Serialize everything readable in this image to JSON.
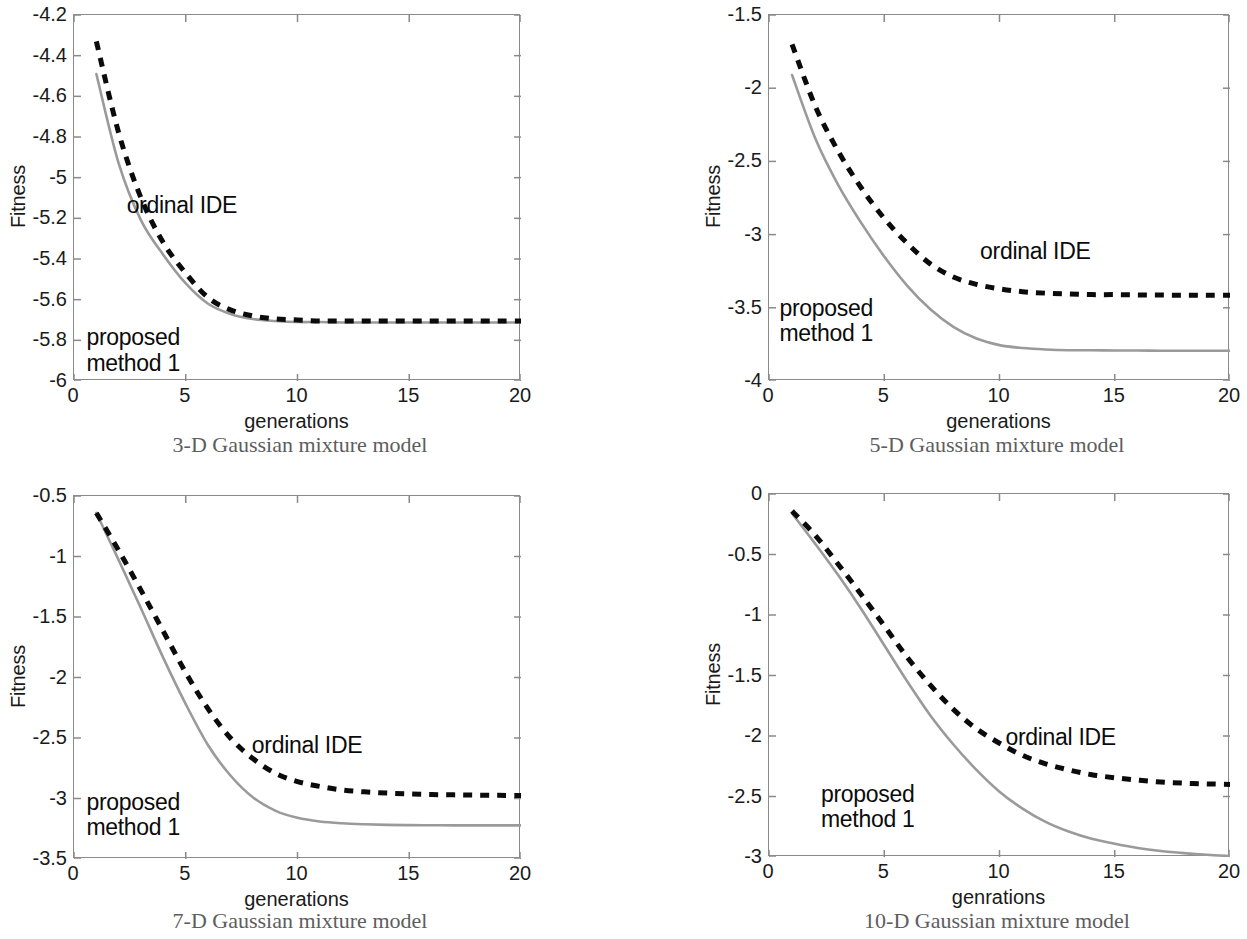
{
  "figure": {
    "background": "#ffffff",
    "axis_color": "#8a8a8a",
    "solid_series_color": "#9a9a9a",
    "dashed_series_color": "#0b0b0b"
  },
  "panels": [
    {
      "id": "panel-3d",
      "caption": "3-D Gaussian mixture model",
      "chart_data": {
        "type": "line",
        "title": "",
        "xlabel": "generations",
        "ylabel": "Fitness",
        "xlim": [
          0,
          20
        ],
        "ylim": [
          -6,
          -4.2
        ],
        "xticks": [
          0,
          5,
          10,
          15,
          20
        ],
        "xticklabels": [
          "0",
          "5",
          "10",
          "15",
          "20"
        ],
        "yticks": [
          -6,
          -5.8,
          -5.6,
          -5.4,
          -5.2,
          -5,
          -4.8,
          -4.6,
          -4.4,
          -4.2
        ],
        "yticklabels": [
          "-6",
          "-5.8",
          "-5.6",
          "-5.4",
          "-5.2",
          "-5",
          "-4.8",
          "-4.6",
          "-4.4",
          "-4.2"
        ],
        "grid": false,
        "legend": "inline-annotations",
        "x": [
          1,
          2,
          3,
          4,
          5,
          6,
          7,
          8,
          9,
          10,
          11,
          12,
          13,
          14,
          15,
          16,
          17,
          18,
          19,
          20
        ],
        "series": [
          {
            "name": "ordinal IDE",
            "style": "dashed",
            "color": "#0b0b0b",
            "values": [
              -4.33,
              -4.78,
              -5.1,
              -5.32,
              -5.47,
              -5.59,
              -5.65,
              -5.68,
              -5.695,
              -5.7,
              -5.705,
              -5.705,
              -5.705,
              -5.705,
              -5.705,
              -5.705,
              -5.705,
              -5.705,
              -5.705,
              -5.705
            ],
            "annotation": {
              "text": "ordinal IDE",
              "x": 2.4,
              "y": -5.15
            }
          },
          {
            "name": "proposed method 1",
            "style": "solid",
            "color": "#9a9a9a",
            "values": [
              -4.49,
              -4.93,
              -5.21,
              -5.38,
              -5.52,
              -5.62,
              -5.67,
              -5.695,
              -5.705,
              -5.71,
              -5.71,
              -5.712,
              -5.712,
              -5.712,
              -5.712,
              -5.712,
              -5.712,
              -5.712,
              -5.712,
              -5.712
            ],
            "annotation": {
              "text": "proposed\nmethod 1",
              "x": 0.6,
              "y": -5.8
            }
          }
        ]
      }
    },
    {
      "id": "panel-5d",
      "caption": "5-D Gaussian mixture model",
      "chart_data": {
        "type": "line",
        "title": "",
        "xlabel": "generations",
        "ylabel": "Fitness",
        "xlim": [
          0,
          20
        ],
        "ylim": [
          -4,
          -1.5
        ],
        "xticks": [
          0,
          5,
          10,
          15,
          20
        ],
        "xticklabels": [
          "0",
          "5",
          "10",
          "15",
          "20"
        ],
        "yticks": [
          -4,
          -3.5,
          -3,
          -2.5,
          -2,
          -1.5
        ],
        "yticklabels": [
          "-4",
          "-3.5",
          "-3",
          "-2.5",
          "-2",
          "-1.5"
        ],
        "grid": false,
        "legend": "inline-annotations",
        "x": [
          1,
          2,
          3,
          4,
          5,
          6,
          7,
          8,
          9,
          10,
          11,
          12,
          13,
          14,
          15,
          16,
          17,
          18,
          19,
          20
        ],
        "series": [
          {
            "name": "ordinal IDE",
            "style": "dashed",
            "color": "#0b0b0b",
            "values": [
              -1.7,
              -2.12,
              -2.43,
              -2.68,
              -2.89,
              -3.06,
              -3.2,
              -3.29,
              -3.34,
              -3.37,
              -3.39,
              -3.4,
              -3.405,
              -3.41,
              -3.41,
              -3.412,
              -3.413,
              -3.414,
              -3.415,
              -3.415
            ],
            "annotation": {
              "text": "ordinal IDE",
              "x": 9.2,
              "y": -3.13
            }
          },
          {
            "name": "proposed method 1",
            "style": "solid",
            "color": "#9a9a9a",
            "values": [
              -1.91,
              -2.34,
              -2.66,
              -2.92,
              -3.15,
              -3.35,
              -3.51,
              -3.63,
              -3.71,
              -3.755,
              -3.775,
              -3.785,
              -3.79,
              -3.79,
              -3.792,
              -3.792,
              -3.793,
              -3.793,
              -3.793,
              -3.793
            ],
            "annotation": {
              "text": "proposed\nmethod 1",
              "x": 0.5,
              "y": -3.52
            }
          }
        ]
      }
    },
    {
      "id": "panel-7d",
      "caption": "7-D Gaussian mixture model",
      "chart_data": {
        "type": "line",
        "title": "",
        "xlabel": "generations",
        "ylabel": "Fitness",
        "xlim": [
          0,
          20
        ],
        "ylim": [
          -3.5,
          -0.5
        ],
        "xticks": [
          0,
          5,
          10,
          15,
          20
        ],
        "xticklabels": [
          "0",
          "5",
          "10",
          "15",
          "20"
        ],
        "yticks": [
          -3.5,
          -3,
          -2.5,
          -2,
          -1.5,
          -1,
          -0.5
        ],
        "yticklabels": [
          "-3.5",
          "-3",
          "-2.5",
          "-2",
          "-1.5",
          "-1",
          "-0.5"
        ],
        "grid": false,
        "legend": "inline-annotations",
        "x": [
          1,
          2,
          3,
          4,
          5,
          6,
          7,
          8,
          9,
          10,
          11,
          12,
          13,
          14,
          15,
          16,
          17,
          18,
          19,
          20
        ],
        "series": [
          {
            "name": "ordinal IDE",
            "style": "dashed",
            "color": "#0b0b0b",
            "values": [
              -0.64,
              -0.95,
              -1.28,
              -1.62,
              -1.96,
              -2.26,
              -2.5,
              -2.67,
              -2.79,
              -2.86,
              -2.9,
              -2.93,
              -2.945,
              -2.955,
              -2.962,
              -2.967,
              -2.97,
              -2.972,
              -2.974,
              -2.975
            ],
            "annotation": {
              "text": "ordinal IDE",
              "x": 8.0,
              "y": -2.58
            }
          },
          {
            "name": "proposed method 1",
            "style": "solid",
            "color": "#9a9a9a",
            "values": [
              -0.64,
              -1.03,
              -1.43,
              -1.84,
              -2.22,
              -2.56,
              -2.81,
              -2.99,
              -3.1,
              -3.16,
              -3.19,
              -3.205,
              -3.213,
              -3.218,
              -3.22,
              -3.221,
              -3.222,
              -3.222,
              -3.222,
              -3.222
            ],
            "annotation": {
              "text": "proposed\nmethod 1",
              "x": 0.6,
              "y": -3.05
            }
          }
        ]
      }
    },
    {
      "id": "panel-10d",
      "caption": "10-D Gaussian mixture model",
      "chart_data": {
        "type": "line",
        "title": "",
        "xlabel": "genrations",
        "ylabel": "Fitness",
        "xlim": [
          0,
          20
        ],
        "ylim": [
          -3,
          0
        ],
        "xticks": [
          0,
          5,
          10,
          15,
          20
        ],
        "xticklabels": [
          "0",
          "5",
          "10",
          "15",
          "20"
        ],
        "yticks": [
          -3,
          -2.5,
          -2,
          -1.5,
          -1,
          -0.5,
          0
        ],
        "yticklabels": [
          "-3",
          "-2.5",
          "-2",
          "-1.5",
          "-1",
          "-0.5",
          "0"
        ],
        "grid": false,
        "legend": "inline-annotations",
        "x": [
          1,
          2,
          3,
          4,
          5,
          6,
          7,
          8,
          9,
          10,
          11,
          12,
          13,
          14,
          15,
          16,
          17,
          18,
          19,
          20
        ],
        "series": [
          {
            "name": "ordinal IDE",
            "style": "dashed",
            "color": "#0b0b0b",
            "values": [
              -0.14,
              -0.34,
              -0.58,
              -0.83,
              -1.09,
              -1.35,
              -1.58,
              -1.78,
              -1.94,
              -2.06,
              -2.16,
              -2.23,
              -2.28,
              -2.32,
              -2.345,
              -2.365,
              -2.38,
              -2.39,
              -2.396,
              -2.4
            ],
            "annotation": {
              "text": "ordinal IDE",
              "x": 10.3,
              "y": -2.03
            }
          },
          {
            "name": "proposed method 1",
            "style": "solid",
            "color": "#9a9a9a",
            "values": [
              -0.16,
              -0.41,
              -0.67,
              -0.95,
              -1.25,
              -1.55,
              -1.83,
              -2.07,
              -2.28,
              -2.46,
              -2.6,
              -2.71,
              -2.79,
              -2.85,
              -2.89,
              -2.925,
              -2.95,
              -2.968,
              -2.982,
              -2.992
            ],
            "annotation": {
              "text": "proposed\nmethod 1",
              "x": 2.3,
              "y": -2.5
            }
          }
        ]
      }
    }
  ]
}
